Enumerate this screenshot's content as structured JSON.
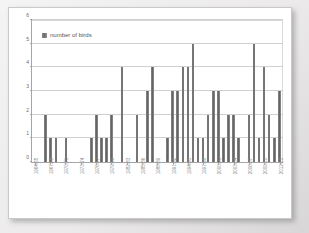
{
  "chart_data": {
    "type": "bar",
    "title": "",
    "xlabel": "",
    "ylabel": "",
    "ylim": [
      0,
      6
    ],
    "yticks": [
      0,
      1,
      2,
      3,
      4,
      5,
      6
    ],
    "grid": true,
    "legend": {
      "position": "top-left",
      "entries": [
        "number of birds"
      ]
    },
    "series": [
      {
        "name": "number of birds",
        "color": "#6e6e6e",
        "values": [
          0,
          0,
          2,
          1,
          1,
          0,
          1,
          0,
          0,
          0,
          0,
          1,
          2,
          1,
          1,
          2,
          0,
          4,
          0,
          0,
          2,
          0,
          3,
          4,
          0,
          0,
          1,
          3,
          3,
          4,
          4,
          5,
          1,
          1,
          2,
          3,
          3,
          1,
          2,
          2,
          1,
          0,
          2,
          5,
          1,
          4,
          2,
          1,
          3
        ]
      }
    ],
    "categories": [
      "1964/65",
      "1965/66",
      "1966/67",
      "1967/68",
      "1968/69",
      "1969/70",
      "1970/71",
      "1971/72",
      "1972/73",
      "1973/74",
      "1974/75",
      "1975/76",
      "1976/77",
      "1977/78",
      "1978/79",
      "1979/80",
      "1980/81",
      "1981/82",
      "1982/83",
      "1983/84",
      "1984/85",
      "1985/86",
      "1986/87",
      "1987/88",
      "1988/89",
      "1989/90",
      "1990/91",
      "1991/92",
      "1992/93",
      "1993/94",
      "1994/95",
      "1995/96",
      "1996/97",
      "1997/98",
      "1998/99",
      "1999/00",
      "2000/01",
      "2001/02",
      "2002/03",
      "2003/04",
      "2004/05",
      "2005/06",
      "2006/07",
      "2007/08",
      "2008/09",
      "2009/10",
      "2010/11",
      "2011/12",
      "2012/13"
    ],
    "visible_tick_labels": [
      "1964/65",
      "1967/68",
      "1970/71",
      "1973/74",
      "1976/77",
      "1979/80",
      "1982/83",
      "1985/86",
      "1988/89",
      "1991/92",
      "1994/95",
      "1997/98",
      "2000/01",
      "2003/04",
      "2006/07"
    ],
    "tick_label_interval": 3
  }
}
